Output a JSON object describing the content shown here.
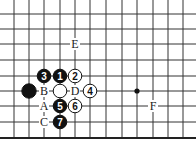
{
  "diagram": {
    "type": "go-board-fragment",
    "grid": {
      "x_lines": [
        14,
        29,
        44,
        60,
        75,
        90,
        106,
        122,
        137,
        153,
        168,
        183
      ],
      "y_lines": [
        14,
        29,
        44,
        60,
        76,
        91,
        106,
        122
      ],
      "edge_y": 138,
      "line_color": "#333333",
      "edge_color": "#222222"
    },
    "star_points": [
      {
        "x": 137,
        "y": 91
      }
    ],
    "stones": [
      {
        "color": "black",
        "x": 44,
        "y": 76,
        "label": "3"
      },
      {
        "color": "black",
        "x": 60,
        "y": 76,
        "label": "1"
      },
      {
        "color": "white",
        "x": 75,
        "y": 76,
        "label": "2"
      },
      {
        "color": "black",
        "x": 29,
        "y": 91,
        "label": ""
      },
      {
        "color": "white",
        "x": 60,
        "y": 91,
        "label": ""
      },
      {
        "color": "white",
        "x": 90,
        "y": 91,
        "label": "4"
      },
      {
        "color": "black",
        "x": 60,
        "y": 106,
        "label": "5"
      },
      {
        "color": "white",
        "x": 75,
        "y": 106,
        "label": "6"
      },
      {
        "color": "black",
        "x": 60,
        "y": 122,
        "label": "7"
      }
    ],
    "letters": [
      {
        "text": "E",
        "x": 75,
        "y": 44
      },
      {
        "text": "B",
        "x": 44,
        "y": 91
      },
      {
        "text": "D",
        "x": 75,
        "y": 91
      },
      {
        "text": "A",
        "x": 44,
        "y": 106
      },
      {
        "text": "C",
        "x": 44,
        "y": 122
      },
      {
        "text": "F",
        "x": 153,
        "y": 106
      }
    ]
  }
}
